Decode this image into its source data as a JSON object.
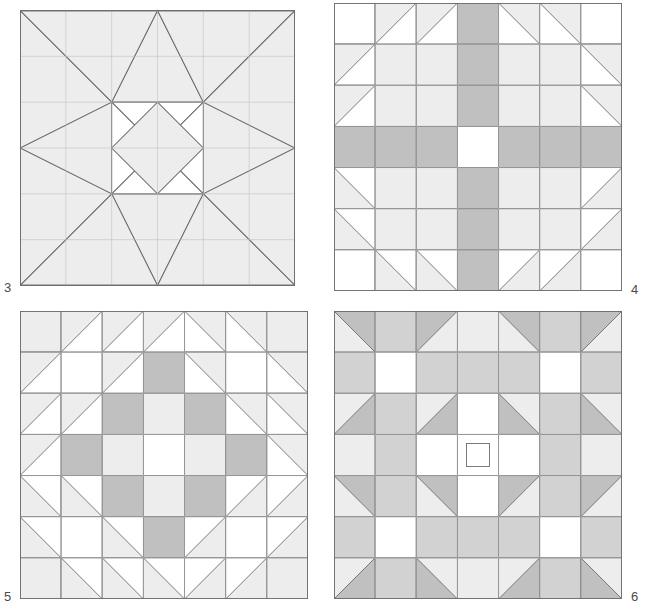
{
  "page": {
    "width": 646,
    "height": 606,
    "background": "#ffffff"
  },
  "palette": {
    "white": "#ffffff",
    "light": "#ededed",
    "medium": "#d2d2d2",
    "dark": "#b4b4b4",
    "line": "#6e6e6e",
    "label_color": "#4a4a4a"
  },
  "blocks": [
    {
      "id": "block-3",
      "label": "3",
      "label_position": "bottom-left-outside",
      "grid": 6,
      "pattern_name": "eight-pointed-star-on-point",
      "x": 20,
      "y": 3,
      "size": 275,
      "colors": {
        "background": "#d2d2d2",
        "star_light": "#ededed",
        "star_white": "#ffffff"
      },
      "notes": "Six by six unit grid. A dark medium-grey field fills the square. A large white on-point square sits in the centre with light grey kite/triangle points radiating to the four edge midpoints and long light grey spikes reaching to the four corners."
    },
    {
      "id": "block-4",
      "label": "4",
      "label_position": "bottom-right-outside",
      "grid": 7,
      "pattern_name": "feathered-cross-with-sawtooth",
      "x": 334,
      "y": 3,
      "size": 288,
      "colors": {
        "background": "#ffffff",
        "light": "#ededed",
        "dark": "#c0c0c0"
      },
      "rows": [
        [
          "white",
          "tri-light-tl",
          "tri-light-tl",
          "dark",
          "tri-light-tr",
          "tri-light-tr",
          "white"
        ],
        [
          "tri-light-tl",
          "light",
          "light",
          "dark",
          "light",
          "light",
          "tri-light-tr"
        ],
        [
          "tri-light-tl",
          "light",
          "light",
          "dark",
          "light",
          "light",
          "tri-light-tr"
        ],
        [
          "dark",
          "dark",
          "dark",
          "white",
          "dark",
          "dark",
          "dark"
        ],
        [
          "tri-light-bl",
          "light",
          "light",
          "dark",
          "light",
          "light",
          "tri-light-br"
        ],
        [
          "tri-light-bl",
          "light",
          "light",
          "dark",
          "light",
          "light",
          "tri-light-br"
        ],
        [
          "white",
          "tri-light-bl",
          "tri-light-bl",
          "dark",
          "tri-light-br",
          "tri-light-br",
          "white"
        ]
      ],
      "notes": "Seven by seven unit grid. A dark grey cross runs through the middle row and middle column with a white square at the very centre. Light grey sawtooth half-square triangles frame the four light grey corner quadrants."
    },
    {
      "id": "block-5",
      "label": "5",
      "label_position": "bottom-left-outside",
      "grid": 7,
      "pattern_name": "sawtooth-chain-cross",
      "x": 20,
      "y": 311,
      "size": 288,
      "colors": {
        "background": "#ffffff",
        "light": "#ededed",
        "dark": "#c0c0c0"
      },
      "rows": [
        [
          "light",
          "tri-light-tl",
          "tri-light-tl",
          "tri-light-tl",
          "tri-light-tr",
          "tri-light-tr",
          "light"
        ],
        [
          "tri-light-tl",
          "white",
          "tri-light-tl",
          "dark",
          "tri-light-tr",
          "white",
          "tri-light-tr"
        ],
        [
          "tri-light-tl",
          "tri-light-tl",
          "dark",
          "light",
          "dark",
          "tri-light-tr",
          "tri-light-tr"
        ],
        [
          "tri-light-tl",
          "dark",
          "light",
          "white",
          "light",
          "dark",
          "tri-light-tr"
        ],
        [
          "tri-light-bl",
          "tri-light-bl",
          "dark",
          "light",
          "dark",
          "tri-light-br",
          "tri-light-br"
        ],
        [
          "tri-light-bl",
          "white",
          "tri-light-bl",
          "dark",
          "tri-light-br",
          "white",
          "tri-light-br"
        ],
        [
          "light",
          "tri-light-bl",
          "tri-light-bl",
          "tri-light-bl",
          "tri-light-br",
          "tri-light-br",
          "light"
        ]
      ],
      "notes": "Seven by seven unit grid. A darker grey cross/plus of squares sits at the centre surrounded by light grey squares, with concentric rings of light grey half-square triangles pointing outward to all four corners."
    },
    {
      "id": "block-6",
      "label": "6",
      "label_position": "bottom-right-outside",
      "grid": 7,
      "pattern_name": "bow-tie-ring-with-centre-square",
      "x": 334,
      "y": 311,
      "size": 288,
      "colors": {
        "background": "#ededed",
        "light": "#ededed",
        "medium": "#d2d2d2",
        "dark": "#c0c0c0",
        "white": "#ffffff"
      },
      "rows": [
        [
          "tri-dark-tr",
          "medium",
          "tri-dark-tl",
          "light",
          "tri-dark-tr",
          "medium",
          "tri-dark-tl"
        ],
        [
          "medium",
          "white",
          "medium",
          "medium",
          "medium",
          "white",
          "medium"
        ],
        [
          "tri-dark-br",
          "medium",
          "tri-dark-br",
          "white",
          "tri-dark-bl",
          "medium",
          "tri-dark-bl"
        ],
        [
          "light",
          "medium",
          "white",
          "boxed-white",
          "white",
          "medium",
          "light"
        ],
        [
          "tri-dark-tr",
          "medium",
          "tri-dark-tr",
          "white",
          "tri-dark-tl",
          "medium",
          "tri-dark-tl"
        ],
        [
          "medium",
          "white",
          "medium",
          "medium",
          "medium",
          "white",
          "medium"
        ],
        [
          "tri-dark-br",
          "medium",
          "tri-dark-bl",
          "light",
          "tri-dark-br",
          "medium",
          "tri-dark-bl"
        ]
      ],
      "notes": "Seven by seven unit grid. Four darker grey bow-tie/triangle clusters at the corners and edges ring a white octagonal centre which contains a small outlined square in the middle unit."
    }
  ]
}
